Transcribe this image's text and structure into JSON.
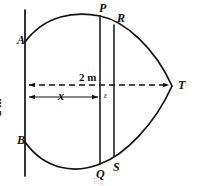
{
  "figure": {
    "kind": "geometry-diagram",
    "stroke_color": "#111111",
    "background_color": "#ffffff",
    "caption": "Fig."
  },
  "points": [
    {
      "id": "A",
      "label": "A",
      "x": 25,
      "y": 42
    },
    {
      "id": "B",
      "label": "B",
      "x": 25,
      "y": 142
    },
    {
      "id": "P",
      "label": "P",
      "x": 100,
      "y": 14
    },
    {
      "id": "R",
      "label": "R",
      "x": 114,
      "y": 22
    },
    {
      "id": "Q",
      "label": "Q",
      "x": 100,
      "y": 166
    },
    {
      "id": "S",
      "label": "S",
      "x": 114,
      "y": 159
    },
    {
      "id": "T",
      "label": "T",
      "x": 172,
      "y": 86
    }
  ],
  "labels": {
    "A": "A",
    "B": "B",
    "P": "P",
    "R": "R",
    "Q": "Q",
    "S": "S",
    "T": "T",
    "epsilon": "ε",
    "x": "x",
    "span_horizontal": "2 m",
    "span_vertical": "2 m"
  },
  "dimensions": [
    {
      "name": "horizontal-span",
      "label": "2 m",
      "style": "dashed",
      "arrowheads": "both",
      "from_x": 27,
      "to_x": 172,
      "y": 85
    },
    {
      "name": "x-distance",
      "label": "x",
      "style": "solid",
      "arrowheads": "both",
      "from_x": 27,
      "to_x": 100,
      "y": 97
    },
    {
      "name": "vertical-span",
      "label": "2 m",
      "style": "implied",
      "orientation": "vertical",
      "x": 10,
      "y": 96
    },
    {
      "name": "epsilon-gap",
      "label": "ε",
      "from_x": 100,
      "to_x": 114,
      "y": 97
    }
  ],
  "geometry": {
    "axis_line": {
      "x": 25,
      "y_top": 10,
      "y_bottom": 176
    },
    "chord_pq": {
      "x": 100,
      "y_top": 17,
      "y_bottom": 163
    },
    "chord_rs": {
      "x": 114,
      "y_top": 26,
      "y_bottom": 155
    },
    "upper_arc": "M 25,42 Q 78,6 172,86",
    "lower_arc": "M 25,142 Q 78,180 172,86"
  }
}
